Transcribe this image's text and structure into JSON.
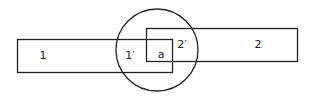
{
  "diagram": {
    "stroke_color": "#222222",
    "background": "#ffffff",
    "shapes": {
      "rect_1": {
        "x": 17,
        "y": 39,
        "w": 155,
        "h": 33
      },
      "rect_2": {
        "x": 146,
        "y": 28,
        "w": 151,
        "h": 33
      },
      "circle": {
        "cx": 157,
        "cy": 50,
        "r": 41
      }
    },
    "labels": {
      "region_1": "1",
      "region_1_prime": "1′",
      "region_a": "a",
      "region_2_prime": "2′",
      "region_2": "2"
    }
  }
}
